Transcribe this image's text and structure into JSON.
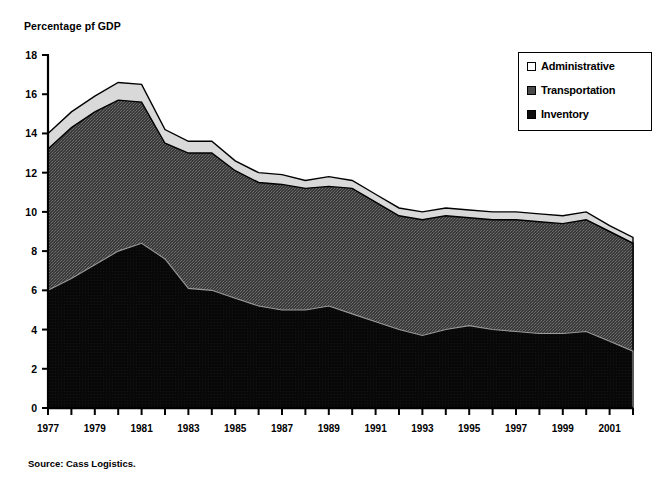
{
  "figure": {
    "axis_title": "Percentage pf GDP",
    "source": "Source:  Cass Logistics."
  },
  "legend": {
    "items": [
      {
        "label": "Administrative",
        "swatch": "white-square-icon",
        "color": "#ffffff"
      },
      {
        "label": "Transportation",
        "swatch": "gray-square-icon",
        "color": "#4a4a4a"
      },
      {
        "label": "Inventory",
        "swatch": "black-square-icon",
        "color": "#0d0d0d"
      }
    ]
  },
  "chart_data": {
    "type": "area",
    "stacked": true,
    "title": "",
    "xlabel": "",
    "ylabel": "Percentage pf GDP",
    "ylim": [
      0,
      18
    ],
    "ytick_step": 2,
    "ytick_labels": [
      "0",
      "2",
      "4",
      "6",
      "8",
      "10",
      "12",
      "14",
      "16",
      "18"
    ],
    "xlim": [
      1977,
      2002
    ],
    "xtick_labels": [
      "1977",
      "1979",
      "1981",
      "1983",
      "1985",
      "1987",
      "1989",
      "1991",
      "1993",
      "1995",
      "1997",
      "1999",
      "2001"
    ],
    "xtick_step": 2,
    "grid": false,
    "legend_position": "top-right",
    "x": [
      1977,
      1978,
      1979,
      1980,
      1981,
      1982,
      1983,
      1984,
      1985,
      1986,
      1987,
      1988,
      1989,
      1990,
      1991,
      1992,
      1993,
      1994,
      1995,
      1996,
      1997,
      1998,
      1999,
      2000,
      2001,
      2002
    ],
    "series": [
      {
        "name": "Inventory",
        "color": "#0d0d0d",
        "values": [
          6.0,
          6.6,
          7.3,
          8.0,
          8.4,
          7.6,
          6.1,
          6.0,
          5.6,
          5.2,
          5.0,
          5.0,
          5.2,
          4.8,
          4.4,
          4.0,
          3.7,
          4.0,
          4.2,
          4.0,
          3.9,
          3.8,
          3.8,
          3.9,
          3.4,
          2.9
        ]
      },
      {
        "name": "Transportation",
        "color": "#4a4a4a",
        "values": [
          7.2,
          7.7,
          7.8,
          7.7,
          7.2,
          5.9,
          6.9,
          7.0,
          6.5,
          6.3,
          6.4,
          6.2,
          6.1,
          6.4,
          6.1,
          5.8,
          5.9,
          5.8,
          5.5,
          5.6,
          5.7,
          5.7,
          5.6,
          5.7,
          5.6,
          5.5
        ]
      },
      {
        "name": "Administrative",
        "color": "#d9d9d9",
        "values": [
          0.8,
          0.8,
          0.8,
          0.9,
          0.9,
          0.7,
          0.6,
          0.6,
          0.5,
          0.5,
          0.5,
          0.4,
          0.5,
          0.4,
          0.4,
          0.4,
          0.4,
          0.4,
          0.4,
          0.4,
          0.4,
          0.4,
          0.4,
          0.4,
          0.3,
          0.3
        ]
      }
    ],
    "totals": [
      14.0,
      15.1,
      15.9,
      16.6,
      16.5,
      14.2,
      13.6,
      13.6,
      12.6,
      12.0,
      11.9,
      11.6,
      11.8,
      11.6,
      11.0,
      10.2,
      10.0,
      10.2,
      10.1,
      10.0,
      10.0,
      9.9,
      9.8,
      10.0,
      9.3,
      8.7
    ]
  }
}
